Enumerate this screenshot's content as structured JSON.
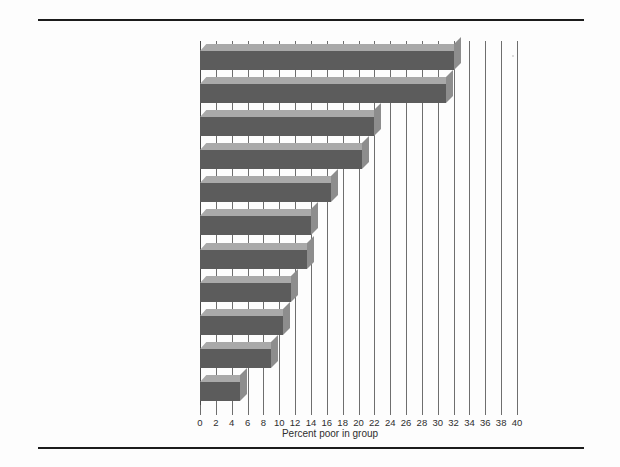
{
  "figure": {
    "background_color": "#fdfdfd",
    "rule_color": "#1c1c1c"
  },
  "chart_data": {
    "type": "bar",
    "orientation": "horizontal",
    "title": "",
    "subtitle": "",
    "xlabel": "Percent poor in group",
    "ylabel": "",
    "xlim": [
      0,
      40
    ],
    "xticks": [
      0,
      2,
      4,
      6,
      8,
      10,
      12,
      14,
      16,
      18,
      20,
      22,
      24,
      26,
      28,
      30,
      32,
      34,
      36,
      38,
      40
    ],
    "xtick_labels": [
      "0",
      "2",
      "4",
      "6",
      "8",
      "10",
      "12",
      "14",
      "16",
      "18",
      "20",
      "22",
      "24",
      "26",
      "28",
      "30",
      "32",
      "34",
      "36",
      "38",
      "40"
    ],
    "grid": true,
    "grid_axis": "x",
    "legend": null,
    "bar_style": "3d-shaded",
    "bar_face_color": "#5c5c5c",
    "bar_top_color": "#a9a9a9",
    "bar_side_color": "#8d8d8d",
    "categories": [
      "Persons in female headed families",
      "Blacks",
      "Unrelated individuals",
      "Persons of Spanish origin",
      "Children, less than 14",
      "Elderly",
      "Residence outside metropolitan area",
      "All persons",
      "Residence inside metropolitan area",
      "Whites",
      "Husband-wife families"
    ],
    "values": [
      32.0,
      31.0,
      22.0,
      20.5,
      16.5,
      14.0,
      13.5,
      11.5,
      10.5,
      9.0,
      5.0
    ]
  }
}
